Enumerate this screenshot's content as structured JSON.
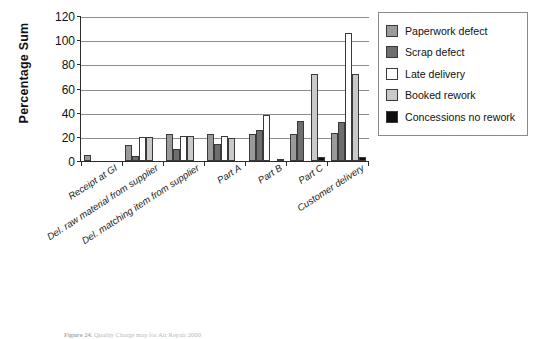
{
  "chart_data": {
    "type": "bar",
    "title": "",
    "xlabel": "",
    "ylabel": "Percentage Sum",
    "ylim": [
      0,
      120
    ],
    "ytick_step": 20,
    "yticks": [
      120,
      100,
      80,
      60,
      40,
      20,
      0
    ],
    "grid": true,
    "legend_position": "right",
    "categories": [
      "Receipt at GI",
      "Del. raw material from supplier",
      "Del. matching item from supplier",
      "Part A",
      "Part B",
      "Part C",
      "Customer delivery"
    ],
    "series": [
      {
        "name": "Paperwork defect",
        "color": "#9a9a9a",
        "values": [
          5,
          13,
          22,
          22,
          22,
          22,
          23
        ]
      },
      {
        "name": "Scrap defect",
        "color": "#6e6e6e",
        "values": [
          0,
          4,
          10,
          14,
          26,
          33,
          32
        ]
      },
      {
        "name": "Late delivery",
        "color": "#ffffff",
        "values": [
          0,
          20,
          21,
          21,
          38,
          0,
          106
        ]
      },
      {
        "name": "Booked rework",
        "color": "#c9c9c9",
        "values": [
          0,
          20,
          21,
          19,
          0,
          72,
          72
        ]
      },
      {
        "name": "Concessions no rework",
        "color": "#0d0d0d",
        "values": [
          0,
          0,
          0,
          0,
          2,
          3,
          3
        ]
      }
    ]
  },
  "legend": {
    "items": [
      {
        "label": "Paperwork defect"
      },
      {
        "label": "Scrap defect"
      },
      {
        "label": "Late delivery"
      },
      {
        "label": "Booked rework"
      },
      {
        "label": "Concessions no rework"
      }
    ]
  },
  "caption": {
    "number": "Figure 24.",
    "text": "Quality Charge map for Air Repair 2000"
  }
}
